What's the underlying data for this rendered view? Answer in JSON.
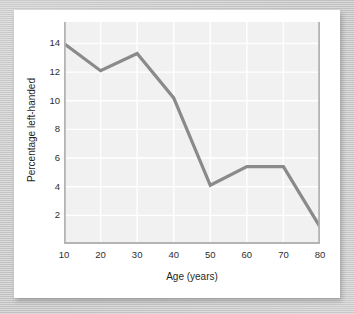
{
  "chart_data": {
    "type": "line",
    "title": "",
    "xlabel": "Age (years)",
    "ylabel": "Percentage left-handed",
    "x": [
      10,
      20,
      30,
      40,
      50,
      60,
      70,
      80
    ],
    "values": [
      14.0,
      12.1,
      13.3,
      10.2,
      4.1,
      5.4,
      5.4,
      1.2
    ],
    "series": [
      {
        "name": "Percentage left-handed",
        "values": [
          14.0,
          12.1,
          13.3,
          10.2,
          4.1,
          5.4,
          5.4,
          1.2
        ]
      }
    ],
    "xtick_labels": [
      "10",
      "20",
      "30",
      "40",
      "50",
      "60",
      "70",
      "80"
    ],
    "ytick_labels": [
      "2",
      "4",
      "6",
      "8",
      "10",
      "12",
      "14"
    ],
    "xticks": [
      10,
      20,
      30,
      40,
      50,
      60,
      70,
      80
    ],
    "yticks": [
      2,
      4,
      6,
      8,
      10,
      12,
      14
    ],
    "xlim": [
      10,
      80
    ],
    "ylim": [
      0,
      15.5
    ],
    "grid": true,
    "legend": false,
    "colors": {
      "line": "#8a8a8a",
      "plot_background": "#f1f1f1",
      "gridline": "#ffffff",
      "card_background": "#ffffff",
      "page_background": "#c9c9c9",
      "tick_text": "#2e2e2e",
      "axis_title_text": "#1f1f1f"
    }
  }
}
